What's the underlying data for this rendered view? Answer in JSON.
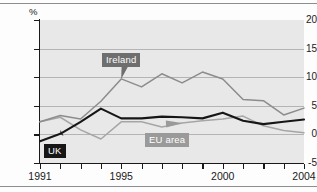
{
  "chart_data": {
    "type": "line",
    "title": "",
    "subtitle": "",
    "xlabel": "",
    "ylabel": "%",
    "unit": "%",
    "grid": true,
    "legend_position": "inline-callouts",
    "xlim": [
      1991,
      2004
    ],
    "ylim": [
      -5,
      20
    ],
    "yticks": [
      20,
      15,
      10,
      5,
      0,
      -5
    ],
    "ytick_labels": [
      "20",
      "15",
      "10",
      "5",
      "0",
      "-5"
    ],
    "x": [
      1991,
      1992,
      1993,
      1994,
      1995,
      1996,
      1997,
      1998,
      1999,
      2000,
      2001,
      2002,
      2003,
      2004
    ],
    "xticks": [
      1991,
      1992,
      1993,
      1994,
      1995,
      1996,
      1997,
      1998,
      1999,
      2000,
      2001,
      2002,
      2003,
      2004
    ],
    "xtick_labels": [
      "1991",
      "",
      "",
      "",
      "1995",
      "",
      "",
      "",
      "",
      "2000",
      "",
      "",
      "",
      "2004"
    ],
    "series": [
      {
        "name": "Ireland",
        "color": "#8c8c8c",
        "values": [
          2.2,
          3.3,
          2.7,
          5.8,
          9.7,
          8.3,
          10.6,
          9.0,
          10.9,
          9.7,
          6.1,
          5.9,
          3.4,
          4.6
        ]
      },
      {
        "name": "UK",
        "color": "#161616",
        "values": [
          -1.2,
          0.1,
          2.2,
          4.5,
          2.8,
          2.8,
          3.1,
          3.0,
          2.8,
          3.8,
          2.4,
          1.8,
          2.2,
          2.6
        ]
      },
      {
        "name": "EU area",
        "color": "#a6a6a6",
        "values": [
          2.2,
          3.0,
          0.8,
          -0.8,
          2.2,
          2.2,
          1.3,
          2.0,
          2.4,
          2.7,
          3.2,
          1.5,
          0.7,
          0.3
        ]
      }
    ],
    "annotations": [
      {
        "label": "Ireland",
        "target_x": 1995,
        "target_y": 9.7
      },
      {
        "label": "UK",
        "target_x": 1992,
        "target_y": 0.1
      },
      {
        "label": "EU area",
        "target_x": 1998,
        "target_y": 2.0
      }
    ]
  },
  "labels": {
    "ireland": "Ireland",
    "uk": "UK",
    "eu_area": "EU area",
    "percent_unit": "%"
  }
}
